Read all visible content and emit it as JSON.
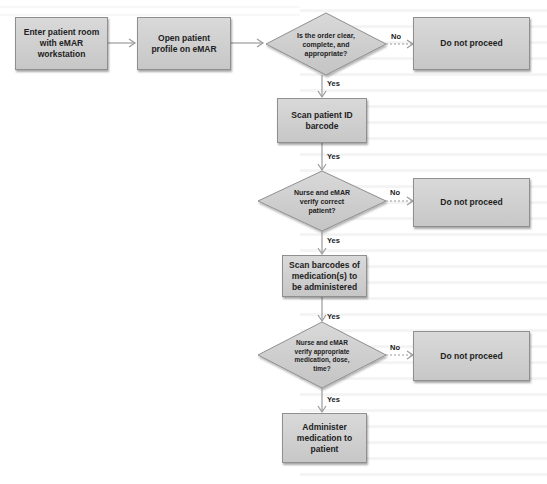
{
  "diagram": {
    "type": "flowchart",
    "nodes": {
      "enter_room": "Enter patient room with eMAR workstation",
      "open_profile": "Open patient profile on eMAR",
      "decision_order": "Is the order clear, complete, and appropriate?",
      "stop_1": "Do not proceed",
      "scan_id": "Scan patient ID barcode",
      "decision_patient": "Nurse and eMAR verify correct patient?",
      "stop_2": "Do not proceed",
      "scan_meds": "Scan barcodes of medication(s) to be administered",
      "decision_meds": "Nurse and eMAR verify appropriate medication, dose, time?",
      "stop_3": "Do not proceed",
      "administer": "Administer medication to patient"
    },
    "edge_labels": {
      "yes": "Yes",
      "no": "No"
    },
    "edges": [
      {
        "from": "enter_room",
        "to": "open_profile",
        "label": ""
      },
      {
        "from": "open_profile",
        "to": "decision_order",
        "label": ""
      },
      {
        "from": "decision_order",
        "to": "stop_1",
        "label": "No"
      },
      {
        "from": "decision_order",
        "to": "scan_id",
        "label": "Yes"
      },
      {
        "from": "scan_id",
        "to": "decision_patient",
        "label": "Yes"
      },
      {
        "from": "decision_patient",
        "to": "stop_2",
        "label": "No"
      },
      {
        "from": "decision_patient",
        "to": "scan_meds",
        "label": "Yes"
      },
      {
        "from": "scan_meds",
        "to": "decision_meds",
        "label": "Yes"
      },
      {
        "from": "decision_meds",
        "to": "stop_3",
        "label": "No"
      },
      {
        "from": "decision_meds",
        "to": "administer",
        "label": "Yes"
      }
    ]
  }
}
